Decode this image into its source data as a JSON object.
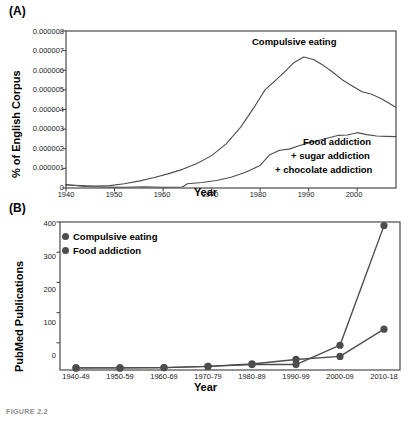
{
  "figure": {
    "caption": "FIGURE 2.2",
    "panel_a_label": "(A)",
    "panel_b_label": "(B)"
  },
  "chart_data": [
    {
      "id": "panel-a",
      "type": "line",
      "title": "",
      "panel": "(A)",
      "xlabel": "Year",
      "ylabel": "% of English Corpus",
      "xlim": [
        1940,
        2008
      ],
      "ylim": [
        0,
        8e-06
      ],
      "grid": false,
      "legend_position": "inline-annotation",
      "xticks": [
        1940,
        1950,
        1960,
        1970,
        1980,
        1990,
        2000
      ],
      "xtick_labels": [
        "1940",
        "1950",
        "1960",
        "1970",
        "1980",
        "1990",
        "2000"
      ],
      "yticks": [
        0,
        1e-06,
        2e-06,
        3e-06,
        4e-06,
        5e-06,
        6e-06,
        7e-06,
        8e-06
      ],
      "ytick_labels": [
        "0",
        "0.000001",
        "0.000002",
        "0.000003",
        "0.000004",
        "0.000005",
        "0.000006",
        "0.000007",
        "0.000008"
      ],
      "annotations": [
        {
          "text": "Compulsive eating",
          "x": 1985,
          "y": 7.3e-06
        },
        {
          "text": "Food addiction",
          "x": 1995,
          "y": 2.2e-06
        },
        {
          "text": "+ sugar addiction",
          "x": 1995,
          "y": 1.6e-06
        },
        {
          "text": "+ chocolate addiction",
          "x": 1995,
          "y": 1e-06
        }
      ],
      "series": [
        {
          "name": "Compulsive eating",
          "color": "#4d4d4d",
          "x": [
            1940,
            1943,
            1946,
            1949,
            1952,
            1955,
            1958,
            1961,
            1964,
            1967,
            1970,
            1973,
            1976,
            1979,
            1981,
            1983,
            1985,
            1987,
            1989,
            1991,
            1993,
            1995,
            1997,
            1999,
            2001,
            2003,
            2005,
            2007,
            2008
          ],
          "y": [
            1.5e-07,
            1.2e-07,
            1e-07,
            1.2e-07,
            2.2e-07,
            3.5e-07,
            5.2e-07,
            7.2e-07,
            9.5e-07,
            1.25e-06,
            1.65e-06,
            2.25e-06,
            3.1e-06,
            4.2e-06,
            5e-06,
            5.45e-06,
            5.9e-06,
            6.4e-06,
            6.68e-06,
            6.55e-06,
            6.25e-06,
            5.9e-06,
            5.5e-06,
            5.2e-06,
            4.9e-06,
            4.78e-06,
            4.55e-06,
            4.25e-06,
            4.1e-06
          ]
        },
        {
          "name": "Food addiction + sugar addiction + chocolate addiction",
          "color": "#4d4d4d",
          "x": [
            1940,
            1944,
            1948,
            1952,
            1956,
            1960,
            1964,
            1965,
            1968,
            1971,
            1974,
            1977,
            1980,
            1982,
            1984,
            1986,
            1988,
            1990,
            1992,
            1994,
            1996,
            1998,
            2000,
            2002,
            2004,
            2006,
            2008
          ],
          "y": [
            1.8e-07,
            8e-08,
            5e-08,
            4e-08,
            6e-08,
            4e-08,
            5e-08,
            2.2e-07,
            2.8e-07,
            3.8e-07,
            5.5e-07,
            8e-07,
            1.15e-06,
            1.7e-06,
            1.92e-06,
            1.98e-06,
            2.15e-06,
            2.3e-06,
            2.42e-06,
            2.55e-06,
            2.68e-06,
            2.7e-06,
            2.82e-06,
            2.72e-06,
            2.65e-06,
            2.63e-06,
            2.62e-06
          ]
        }
      ]
    },
    {
      "id": "panel-b",
      "type": "line",
      "panel": "(B)",
      "xlabel": "Year",
      "ylabel": "PubMed Publications",
      "categories": [
        "1940-49",
        "1950-59",
        "1960-69",
        "1970-79",
        "1980-89",
        "1990-99",
        "2000-09",
        "2010-18"
      ],
      "yticks": [
        0,
        100,
        200,
        300,
        400
      ],
      "ytick_labels": [
        "0",
        "100",
        "200",
        "300",
        "400"
      ],
      "ylim": [
        -90,
        400
      ],
      "grid": false,
      "legend_position": "top-left",
      "marker": "circle",
      "series": [
        {
          "name": "Compulsive eating",
          "color": "#4d4d4d",
          "values": [
            -83,
            -83,
            -82,
            -78,
            -70,
            -55,
            -45,
            45
          ]
        },
        {
          "name": "Food addiction",
          "color": "#4d4d4d",
          "values": [
            -83,
            -83,
            -82,
            -78,
            -72,
            -72,
            -8,
            388
          ]
        }
      ]
    }
  ]
}
